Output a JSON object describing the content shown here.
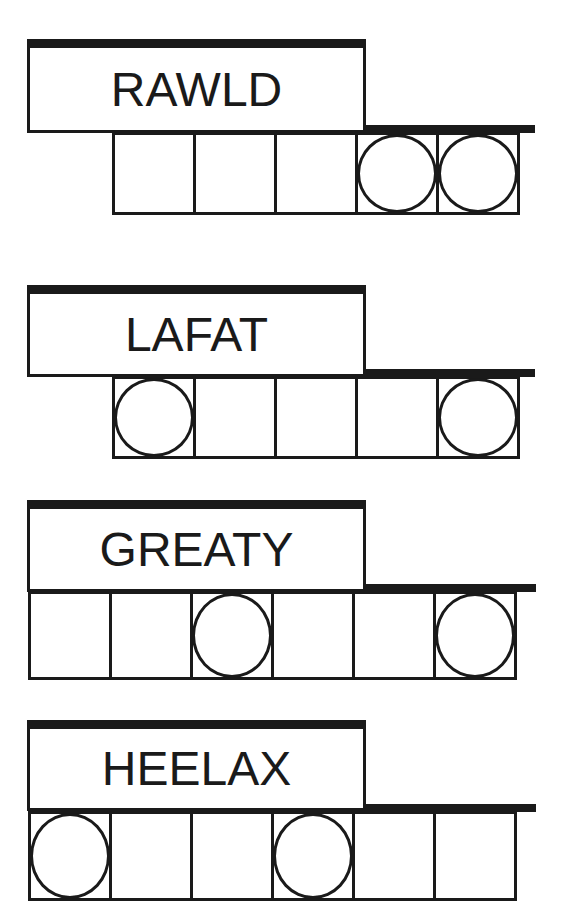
{
  "puzzles": [
    {
      "scrambled": "RAWLD",
      "length": 5,
      "circled": [
        4,
        5
      ]
    },
    {
      "scrambled": "LAFAT",
      "length": 5,
      "circled": [
        1,
        5
      ]
    },
    {
      "scrambled": "GREATY",
      "length": 6,
      "circled": [
        3,
        6
      ]
    },
    {
      "scrambled": "HEELAX",
      "length": 6,
      "circled": [
        1,
        4
      ]
    }
  ],
  "colors": {
    "ink": "#1a1a1a",
    "paper": "#ffffff"
  }
}
